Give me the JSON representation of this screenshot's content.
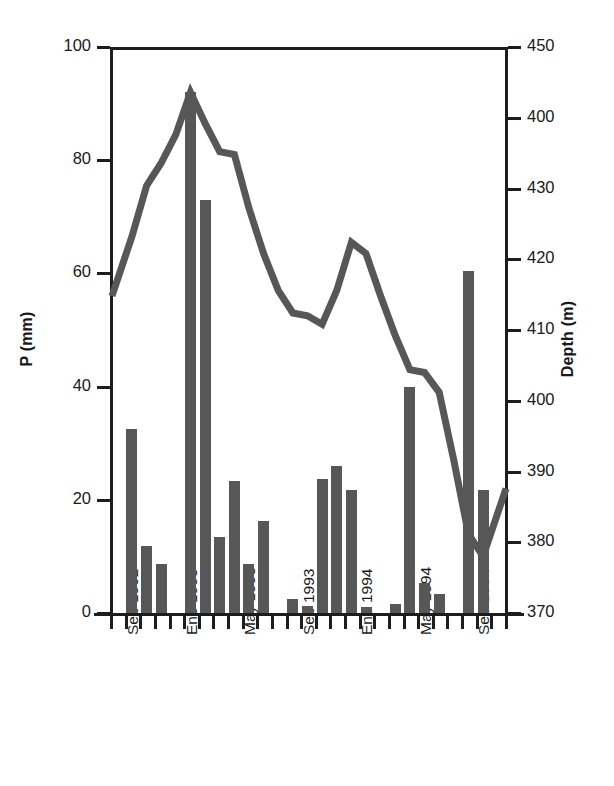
{
  "chart_data": {
    "type": "bar",
    "title": "",
    "subtitle": "",
    "xlabel": "",
    "ylabel": "P (mm)",
    "y2label": "Depth (m)",
    "grid": false,
    "legend": "none",
    "ylim": [
      0,
      100
    ],
    "y2lim": [
      450,
      370
    ],
    "y_ticks": [
      "0",
      "20",
      "40",
      "60",
      "80",
      "100"
    ],
    "y_tick_values": [
      0,
      20,
      40,
      60,
      80,
      100
    ],
    "y2_ticks": [
      "450",
      "400",
      "430",
      "420",
      "410",
      "400",
      "390",
      "380",
      "370"
    ],
    "y2_tick_values": [
      450,
      440,
      430,
      420,
      410,
      400,
      390,
      380,
      370
    ],
    "x_tick_labels": [
      "Sep 1992",
      "Ene 1993",
      "May 1993",
      "Sep 1993",
      "Ene 1994",
      "May 1994",
      "Sep 1994"
    ],
    "x_tick_label_indices": [
      0,
      4,
      8,
      12,
      16,
      20,
      24
    ],
    "categories": [
      "Sep 1992",
      "Oct 1992",
      "Nov 1992",
      "Dic 1992",
      "Ene 1993",
      "Feb 1993",
      "Mar 1993",
      "Abr 1993",
      "May 1993",
      "Jun 1993",
      "Jul 1993",
      "Ago 1993",
      "Sep 1993",
      "Oct 1993",
      "Nov 1993",
      "Dic 1993",
      "Ene 1994",
      "Feb 1994",
      "Mar 1994",
      "Abr 1994",
      "May 1994",
      "Jun 1994",
      "Jul 1994",
      "Ago 1994",
      "Sep 1994",
      "Oct 1994",
      "Nov 1994"
    ],
    "series": [
      {
        "name": "P (mm)",
        "type": "bar",
        "axis": "left",
        "color": "#575757",
        "values": [
          0,
          32.5,
          11.8,
          8.6,
          0,
          92.0,
          73.0,
          13.5,
          23.3,
          8.7,
          16.2,
          0,
          2.5,
          1.2,
          23.7,
          26.0,
          21.8,
          1.1,
          0,
          1.6,
          40.0,
          5.3,
          3.4,
          0,
          60.5,
          21.7,
          0
        ]
      },
      {
        "name": "Depth (m)",
        "type": "line",
        "axis": "right",
        "color": "#575757",
        "values_left_scale": [
          56.0,
          66.5,
          75.5,
          79.5,
          84.5,
          92.0,
          86.5,
          81.5,
          81.0,
          71.5,
          63.5,
          57.0,
          53.0,
          52.5,
          51.0,
          57.0,
          65.5,
          63.5,
          56.0,
          49.0,
          43.0,
          42.5,
          39.0,
          27.0,
          14.0,
          10.0,
          22.0
        ],
        "values_depth_m": [
          414,
          403,
          395,
          390,
          386,
          378,
          383,
          388,
          389,
          398,
          406,
          413,
          417,
          417,
          419,
          413,
          404,
          406,
          414,
          421,
          427,
          427,
          431,
          443,
          456,
          460,
          448
        ]
      }
    ]
  },
  "axes": {
    "left_title": "P (mm)",
    "right_title": "Depth (m)"
  }
}
